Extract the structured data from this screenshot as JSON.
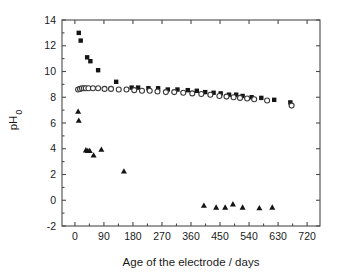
{
  "chart_data": {
    "type": "scatter",
    "title": "",
    "xlabel": "Age of the electrode / days",
    "ylabel": "pH",
    "ylabel_sub": "0",
    "xlim": [
      -40,
      760
    ],
    "ylim": [
      -2,
      14
    ],
    "xticks": [
      0,
      90,
      180,
      270,
      360,
      450,
      540,
      630,
      720
    ],
    "yticks": [
      -2,
      0,
      2,
      4,
      6,
      8,
      10,
      12,
      14
    ],
    "xtick_labels": [
      "0",
      "90",
      "180",
      "270",
      "360",
      "450",
      "540",
      "630",
      "720"
    ],
    "ytick_labels": [
      "-2",
      "0",
      "2",
      "4",
      "6",
      "8",
      "10",
      "12",
      "14"
    ],
    "grid": false,
    "legend": "none",
    "series": [
      {
        "name": "filled-squares",
        "marker": "square",
        "fill": "#141414",
        "points": [
          [
            12,
            13.0
          ],
          [
            18,
            12.4
          ],
          [
            38,
            11.1
          ],
          [
            48,
            10.8
          ],
          [
            72,
            10.1
          ],
          [
            128,
            9.2
          ],
          [
            176,
            8.75
          ],
          [
            196,
            8.75
          ],
          [
            228,
            8.7
          ],
          [
            258,
            8.7
          ],
          [
            288,
            8.6
          ],
          [
            318,
            8.6
          ],
          [
            350,
            8.55
          ],
          [
            378,
            8.5
          ],
          [
            404,
            8.4
          ],
          [
            430,
            8.35
          ],
          [
            452,
            8.3
          ],
          [
            478,
            8.2
          ],
          [
            500,
            8.2
          ],
          [
            520,
            8.1
          ],
          [
            548,
            8.0
          ],
          [
            578,
            7.95
          ],
          [
            618,
            7.8
          ],
          [
            668,
            7.6
          ]
        ]
      },
      {
        "name": "open-circles",
        "marker": "circle",
        "fill": "#ffffff",
        "points": [
          [
            10,
            8.6
          ],
          [
            16,
            8.65
          ],
          [
            22,
            8.7
          ],
          [
            28,
            8.7
          ],
          [
            34,
            8.7
          ],
          [
            42,
            8.7
          ],
          [
            56,
            8.7
          ],
          [
            72,
            8.7
          ],
          [
            92,
            8.65
          ],
          [
            112,
            8.65
          ],
          [
            136,
            8.6
          ],
          [
            160,
            8.6
          ],
          [
            184,
            8.55
          ],
          [
            208,
            8.5
          ],
          [
            232,
            8.5
          ],
          [
            256,
            8.45
          ],
          [
            282,
            8.4
          ],
          [
            308,
            8.4
          ],
          [
            336,
            8.35
          ],
          [
            364,
            8.3
          ],
          [
            392,
            8.25
          ],
          [
            420,
            8.2
          ],
          [
            448,
            8.1
          ],
          [
            470,
            8.05
          ],
          [
            492,
            8.0
          ],
          [
            512,
            7.95
          ],
          [
            534,
            7.9
          ],
          [
            556,
            7.85
          ],
          [
            596,
            7.75
          ],
          [
            672,
            7.35
          ]
        ]
      },
      {
        "name": "filled-triangles",
        "marker": "triangle",
        "fill": "#141414",
        "points": [
          [
            10,
            6.9
          ],
          [
            12,
            6.2
          ],
          [
            34,
            3.9
          ],
          [
            40,
            3.85
          ],
          [
            46,
            3.85
          ],
          [
            58,
            3.5
          ],
          [
            82,
            3.95
          ],
          [
            152,
            2.25
          ],
          [
            400,
            -0.4
          ],
          [
            438,
            -0.55
          ],
          [
            466,
            -0.55
          ],
          [
            490,
            -0.3
          ],
          [
            520,
            -0.55
          ],
          [
            572,
            -0.6
          ],
          [
            612,
            -0.55
          ]
        ]
      }
    ]
  },
  "axes": {
    "x_title": "Age of the electrode / days",
    "y_title_main": "pH",
    "y_title_sub": "0"
  }
}
